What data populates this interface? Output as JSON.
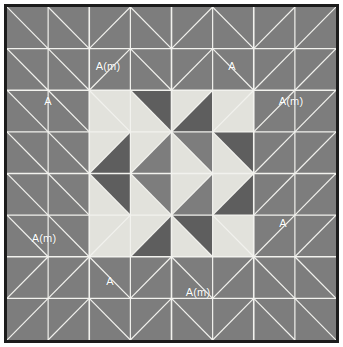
{
  "figure": {
    "name": "quilt-block-diagram",
    "width": 343,
    "height": 347,
    "background": "#ffffff"
  },
  "frame": {
    "border_color": "#1c1c1c",
    "border_width": 3,
    "x": 4,
    "y": 4,
    "width": 335,
    "height": 339
  },
  "palette": {
    "medium": "#7d7d7d",
    "dark": "#5e5e5e",
    "light": "#e2e2dc",
    "seam": "#f2f2ee",
    "border": "#1c1c1c",
    "label_text": "#ffffff"
  },
  "grid": {
    "columns": 8,
    "rows": 8,
    "cell_width": 41.125,
    "cell_height": 41.625,
    "seam_line_width": 1.2
  },
  "labels": [
    {
      "id": "top-left-inner",
      "text": "A(m)",
      "x": 108,
      "y": 66
    },
    {
      "id": "top-right-inner",
      "text": "A",
      "x": 232,
      "y": 66
    },
    {
      "id": "left-upper",
      "text": "A",
      "x": 48,
      "y": 101
    },
    {
      "id": "right-upper",
      "text": "A(m)",
      "x": 291,
      "y": 101
    },
    {
      "id": "left-lower",
      "text": "A(m)",
      "x": 44,
      "y": 238
    },
    {
      "id": "right-lower",
      "text": "A",
      "x": 283,
      "y": 223
    },
    {
      "id": "bottom-left-inner",
      "text": "A",
      "x": 110,
      "y": 281
    },
    {
      "id": "bottom-right-inner",
      "text": "A(m)",
      "x": 198,
      "y": 292
    }
  ],
  "chart_data": {
    "type": "heatmap",
    "title": "",
    "legend": [
      "medium",
      "dark",
      "light"
    ],
    "cells": [
      [
        {
          "bl": "medium",
          "tr": "medium",
          "split": "tlbr"
        },
        {
          "bl": "medium",
          "tr": "medium",
          "split": "tlbr"
        },
        {
          "bl": "medium",
          "tr": "medium",
          "split": "trbl"
        },
        {
          "bl": "medium",
          "tr": "medium",
          "split": "tlbr"
        },
        {
          "bl": "medium",
          "tr": "medium",
          "split": "trbl"
        },
        {
          "bl": "medium",
          "tr": "medium",
          "split": "tlbr"
        },
        {
          "bl": "medium",
          "tr": "medium",
          "split": "trbl"
        },
        {
          "bl": "medium",
          "tr": "medium",
          "split": "trbl"
        }
      ],
      [
        {
          "bl": "medium",
          "tr": "medium",
          "split": "tlbr"
        },
        {
          "bl": "medium",
          "tr": "medium",
          "split": "tlbr"
        },
        {
          "bl": "medium",
          "tr": "medium",
          "split": "trbl"
        },
        {
          "bl": "medium",
          "tr": "medium",
          "split": "tlbr"
        },
        {
          "bl": "medium",
          "tr": "medium",
          "split": "trbl"
        },
        {
          "bl": "medium",
          "tr": "medium",
          "split": "tlbr"
        },
        {
          "bl": "medium",
          "tr": "medium",
          "split": "trbl"
        },
        {
          "bl": "medium",
          "tr": "medium",
          "split": "trbl"
        }
      ],
      [
        {
          "bl": "medium",
          "tr": "medium",
          "split": "tlbr"
        },
        {
          "bl": "medium",
          "tr": "medium",
          "split": "tlbr"
        },
        {
          "bl": "light",
          "tr": "light",
          "split": "tlbr"
        },
        {
          "bl": "light",
          "tr": "dark",
          "split": "tlbr"
        },
        {
          "bl": "dark",
          "tr": "light",
          "split": "trbl"
        },
        {
          "bl": "light",
          "tr": "light",
          "split": "trbl"
        },
        {
          "bl": "medium",
          "tr": "medium",
          "split": "trbl"
        },
        {
          "bl": "medium",
          "tr": "medium",
          "split": "trbl"
        }
      ],
      [
        {
          "bl": "medium",
          "tr": "medium",
          "split": "tlbr"
        },
        {
          "bl": "medium",
          "tr": "medium",
          "split": "tlbr"
        },
        {
          "bl": "dark",
          "tr": "light",
          "split": "trbl"
        },
        {
          "bl": "medium",
          "tr": "light",
          "split": "trbl"
        },
        {
          "bl": "light",
          "tr": "medium",
          "split": "tlbr"
        },
        {
          "bl": "light",
          "tr": "dark",
          "split": "tlbr"
        },
        {
          "bl": "medium",
          "tr": "medium",
          "split": "trbl"
        },
        {
          "bl": "medium",
          "tr": "medium",
          "split": "trbl"
        }
      ],
      [
        {
          "bl": "medium",
          "tr": "medium",
          "split": "tlbr"
        },
        {
          "bl": "medium",
          "tr": "medium",
          "split": "tlbr"
        },
        {
          "bl": "light",
          "tr": "dark",
          "split": "tlbr"
        },
        {
          "bl": "light",
          "tr": "medium",
          "split": "tlbr"
        },
        {
          "bl": "medium",
          "tr": "light",
          "split": "trbl"
        },
        {
          "bl": "dark",
          "tr": "light",
          "split": "trbl"
        },
        {
          "bl": "medium",
          "tr": "medium",
          "split": "trbl"
        },
        {
          "bl": "medium",
          "tr": "medium",
          "split": "trbl"
        }
      ],
      [
        {
          "bl": "medium",
          "tr": "medium",
          "split": "tlbr"
        },
        {
          "bl": "medium",
          "tr": "medium",
          "split": "tlbr"
        },
        {
          "bl": "light",
          "tr": "light",
          "split": "trbl"
        },
        {
          "bl": "dark",
          "tr": "light",
          "split": "trbl"
        },
        {
          "bl": "light",
          "tr": "dark",
          "split": "tlbr"
        },
        {
          "bl": "light",
          "tr": "light",
          "split": "tlbr"
        },
        {
          "bl": "medium",
          "tr": "medium",
          "split": "trbl"
        },
        {
          "bl": "medium",
          "tr": "medium",
          "split": "trbl"
        }
      ],
      [
        {
          "bl": "medium",
          "tr": "medium",
          "split": "trbl"
        },
        {
          "bl": "medium",
          "tr": "medium",
          "split": "trbl"
        },
        {
          "bl": "medium",
          "tr": "medium",
          "split": "tlbr"
        },
        {
          "bl": "medium",
          "tr": "medium",
          "split": "trbl"
        },
        {
          "bl": "medium",
          "tr": "medium",
          "split": "tlbr"
        },
        {
          "bl": "medium",
          "tr": "medium",
          "split": "trbl"
        },
        {
          "bl": "medium",
          "tr": "medium",
          "split": "tlbr"
        },
        {
          "bl": "medium",
          "tr": "medium",
          "split": "tlbr"
        }
      ],
      [
        {
          "bl": "medium",
          "tr": "medium",
          "split": "trbl"
        },
        {
          "bl": "medium",
          "tr": "medium",
          "split": "trbl"
        },
        {
          "bl": "medium",
          "tr": "medium",
          "split": "tlbr"
        },
        {
          "bl": "medium",
          "tr": "medium",
          "split": "trbl"
        },
        {
          "bl": "medium",
          "tr": "medium",
          "split": "tlbr"
        },
        {
          "bl": "medium",
          "tr": "medium",
          "split": "trbl"
        },
        {
          "bl": "medium",
          "tr": "medium",
          "split": "tlbr"
        },
        {
          "bl": "medium",
          "tr": "medium",
          "split": "tlbr"
        }
      ]
    ]
  }
}
